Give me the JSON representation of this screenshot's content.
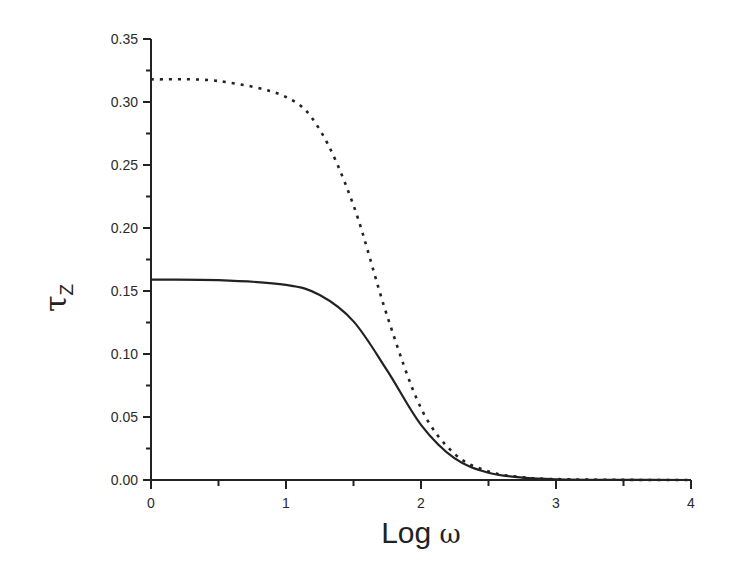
{
  "chart_data": {
    "type": "line",
    "title": "",
    "xlabel": "Log ω",
    "ylabel": "τZ",
    "xlim": [
      0,
      4
    ],
    "ylim": [
      0,
      0.35
    ],
    "grid": false,
    "legend": null,
    "x_ticks": [
      "0",
      "1",
      "2",
      "3",
      "4"
    ],
    "y_ticks": [
      "0.00",
      "0.05",
      "0.10",
      "0.15",
      "0.20",
      "0.25",
      "0.30",
      "0.35"
    ],
    "x": [
      0,
      0.5,
      1.0,
      1.25,
      1.5,
      1.75,
      2.0,
      2.25,
      2.5,
      2.75,
      3.0,
      3.5,
      4.0
    ],
    "series": [
      {
        "name": "dotted",
        "style": "dotted",
        "color": "#222222",
        "values": [
          0.318,
          0.3166,
          0.304,
          0.278,
          0.218,
          0.13,
          0.057,
          0.0206,
          0.0068,
          0.0022,
          0.0007,
          0.0001,
          0.0
        ]
      },
      {
        "name": "solid",
        "style": "solid",
        "color": "#222222",
        "values": [
          0.159,
          0.1586,
          0.1549,
          0.1468,
          0.1259,
          0.0868,
          0.0438,
          0.0171,
          0.0058,
          0.0019,
          0.0006,
          0.0001,
          0.0
        ]
      }
    ]
  },
  "labels": {
    "xlabel_main": "Log",
    "xlabel_symbol": "ω",
    "ylabel_main": "τ",
    "ylabel_sub": "Z"
  }
}
